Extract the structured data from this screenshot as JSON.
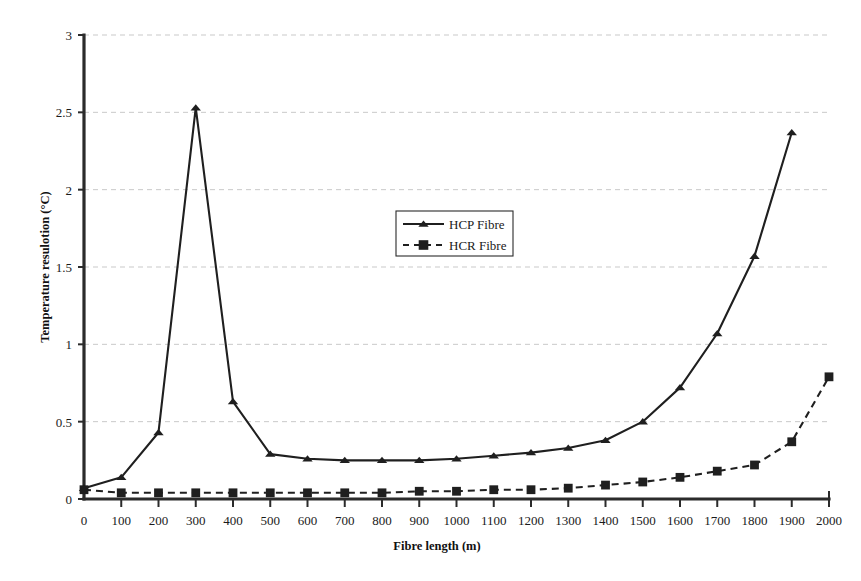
{
  "chart_data": {
    "type": "line",
    "title": "",
    "xlabel": "Fibre length (m)",
    "ylabel": "Temperature resulotion (°C)",
    "xlim": [
      0,
      2000
    ],
    "ylim": [
      0,
      3
    ],
    "xticks": [
      0,
      100,
      200,
      300,
      400,
      500,
      600,
      700,
      800,
      900,
      1000,
      1100,
      1200,
      1300,
      1400,
      1500,
      1600,
      1700,
      1800,
      1900,
      2000
    ],
    "xtick_labels": [
      "0",
      "100",
      "200",
      "300",
      "400",
      "500",
      "600",
      "700",
      "800",
      "900",
      "1000",
      "1100",
      "1200",
      "1300",
      "1400",
      "1500",
      "1600",
      "1700",
      "1800",
      "1900",
      "2000"
    ],
    "yticks": [
      0,
      0.5,
      1,
      1.5,
      2,
      2.5,
      3
    ],
    "ytick_labels": [
      "0",
      "0.5",
      "1",
      "1.5",
      "2",
      "2.5",
      "3"
    ],
    "grid": "horizontal-dashed",
    "legend_position": "upper-center",
    "x": [
      0,
      100,
      200,
      300,
      400,
      500,
      600,
      700,
      800,
      900,
      1000,
      1100,
      1200,
      1300,
      1400,
      1500,
      1600,
      1700,
      1800,
      1900,
      2000
    ],
    "series": [
      {
        "name": "HCP Fibre",
        "marker": "triangle",
        "linestyle": "solid",
        "color": "#1f1f1f",
        "x": [
          0,
          100,
          200,
          300,
          400,
          500,
          600,
          700,
          800,
          900,
          1000,
          1100,
          1200,
          1300,
          1400,
          1500,
          1600,
          1700,
          1800,
          1900
        ],
        "values": [
          0.07,
          0.14,
          0.43,
          2.53,
          0.63,
          0.29,
          0.26,
          0.25,
          0.25,
          0.25,
          0.26,
          0.28,
          0.3,
          0.33,
          0.38,
          0.5,
          0.72,
          1.07,
          1.57,
          2.37
        ]
      },
      {
        "name": "HCR Fibre",
        "marker": "square",
        "linestyle": "dashed",
        "color": "#1f1f1f",
        "x": [
          0,
          100,
          200,
          300,
          400,
          500,
          600,
          700,
          800,
          900,
          1000,
          1100,
          1200,
          1300,
          1400,
          1500,
          1600,
          1700,
          1800,
          1900,
          2000
        ],
        "values": [
          0.06,
          0.04,
          0.04,
          0.04,
          0.04,
          0.04,
          0.04,
          0.04,
          0.04,
          0.05,
          0.05,
          0.06,
          0.06,
          0.07,
          0.09,
          0.11,
          0.14,
          0.18,
          0.22,
          0.37,
          0.79
        ]
      }
    ],
    "legend": [
      {
        "label": "HCP Fibre",
        "marker": "triangle",
        "linestyle": "solid"
      },
      {
        "label": "HCR Fibre",
        "marker": "square",
        "linestyle": "dashed"
      }
    ]
  }
}
